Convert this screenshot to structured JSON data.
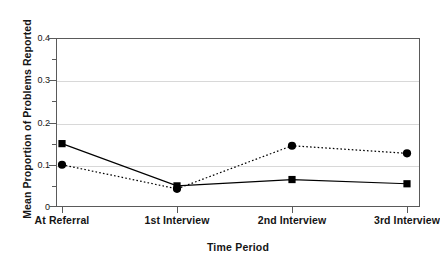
{
  "chart_data": {
    "type": "line",
    "title": "",
    "xlabel": "Time Period",
    "ylabel": "Mean Proportion of Problems Reported",
    "categories": [
      "At Referral",
      "1st Interview",
      "2nd Interview",
      "3rd Interview"
    ],
    "series": [
      {
        "name": "solid-square-series",
        "marker": "square",
        "linestyle": "solid",
        "color": "#000000",
        "values": [
          0.15,
          0.05,
          0.065,
          0.055
        ]
      },
      {
        "name": "dotted-circle-series",
        "marker": "circle",
        "linestyle": "dotted",
        "color": "#000000",
        "values": [
          0.1,
          0.043,
          0.145,
          0.127
        ]
      }
    ],
    "ylim": [
      0,
      0.4
    ],
    "y_major_ticks": [
      0,
      0.1,
      0.2,
      0.3,
      0.4
    ],
    "y_minor_ticks": [
      0.05,
      0.15,
      0.25,
      0.35
    ],
    "y_tick_labels": [
      "0",
      "0.1",
      "0.2",
      "0.3",
      "0.4"
    ],
    "grid": true,
    "grid_axis": "y",
    "legend": "none",
    "legend_position": "none"
  },
  "axes": {
    "y_labels": [
      {
        "text": "0.4",
        "value": 0.4
      },
      {
        "text": "0.3",
        "value": 0.3
      },
      {
        "text": "0.2",
        "value": 0.2
      },
      {
        "text": "0.1",
        "value": 0.1
      },
      {
        "text": "0",
        "value": 0
      }
    ],
    "x_labels": [
      {
        "text": "At Referral"
      },
      {
        "text": "1st Interview"
      },
      {
        "text": "2nd Interview"
      },
      {
        "text": "3rd Interview"
      }
    ]
  },
  "colors": {
    "frame": "#5a5a5a",
    "grid": "#d8d8d8",
    "ink": "#000000",
    "background": "#ffffff"
  }
}
